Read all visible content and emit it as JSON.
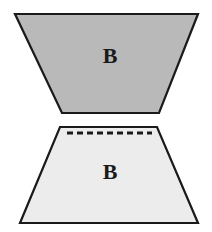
{
  "figure": {
    "background_color": "#ffffff",
    "outline_color": "#1a1a1a",
    "canvas": {
      "width": 212,
      "height": 232
    },
    "shapes": [
      {
        "id": "upper-trapezoid",
        "name": "upper-trapezoid",
        "orientation": "narrow-bottom",
        "label": "B",
        "fill_color": "#b9b9b9",
        "stroke_color": "#1a1a1a",
        "stroke_width": 2.2,
        "points": "15,14 198,14 159,113 62,113",
        "label_x": 110,
        "label_y": 58,
        "label_size": 22
      },
      {
        "id": "lower-trapezoid",
        "name": "lower-trapezoid",
        "orientation": "narrow-top",
        "label": "B",
        "fill_color": "#ececec",
        "stroke_color": "#1a1a1a",
        "stroke_width": 2.2,
        "points": "60,127 157,127 198,223 20,223",
        "label_x": 110,
        "label_y": 174,
        "label_size": 22
      }
    ],
    "dashed_line": {
      "name": "dashed-guide-line",
      "x1": 67,
      "y1": 133,
      "x2": 152,
      "y2": 133,
      "color": "#1a1a1a",
      "width": 3,
      "dash_pattern": "6 4"
    }
  }
}
